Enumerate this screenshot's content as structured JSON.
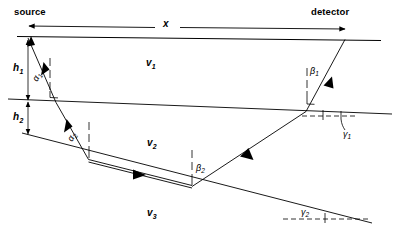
{
  "figure": {
    "background_color": "#ffffff",
    "line_color": "#000000",
    "width": 395,
    "height": 240
  },
  "annotations": {
    "source_label": "source",
    "detector_label": "detector",
    "offset_label": "x",
    "depth1_label": "h",
    "depth1_sub": "1",
    "depth2_label": "h",
    "depth2_sub": "2",
    "velocity1_label": "v",
    "velocity1_sub": "1",
    "velocity2_label": "v",
    "velocity2_sub": "2",
    "velocity3_label": "v",
    "velocity3_sub": "3",
    "alpha1_label": "α",
    "alpha1_sub": "1",
    "alpha2_label": "α",
    "alpha2_sub": "2",
    "beta1_label": "β",
    "beta1_sub": "1",
    "beta2_label": "β",
    "beta2_sub": "2",
    "gamma1_label": "γ",
    "gamma1_sub": "1",
    "gamma2_label": "γ",
    "gamma2_sub": "2"
  },
  "geometry": {
    "surface": {
      "x1": 17,
      "y1": 36,
      "x2": 380,
      "y2": 40
    },
    "interface1": {
      "x1": 8,
      "y1": 99,
      "x2": 392,
      "y2": 114
    },
    "interface2": {
      "x1": 22,
      "y1": 133,
      "x2": 370,
      "y2": 222
    },
    "source_point": {
      "x": 28,
      "y": 38
    },
    "detector_point": {
      "x": 345,
      "y": 39
    },
    "refraction_point_1_down": {
      "x": 55,
      "y": 102
    },
    "refraction_point_2_down": {
      "x": 88,
      "y": 159
    },
    "refraction_point_2_up": {
      "x": 192,
      "y": 185
    },
    "refraction_point_1_up": {
      "x": 306,
      "y": 111
    },
    "dip_angle_gamma1_deg": 2.2,
    "dip_angle_gamma2_deg": 14.5
  },
  "layers": [
    {
      "name": "layer-1",
      "velocity": "v1"
    },
    {
      "name": "layer-2",
      "velocity": "v2"
    },
    {
      "name": "layer-3",
      "velocity": "v3"
    }
  ]
}
